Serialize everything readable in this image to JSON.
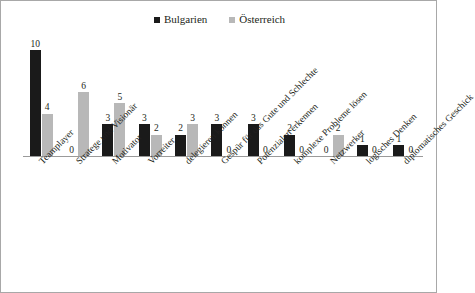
{
  "legend": {
    "entries": [
      {
        "label": "Bulgarien",
        "color": "#1a1a1a",
        "icon": "legend-square-icon"
      },
      {
        "label": "Österreich",
        "color": "#b8b8b8",
        "icon": "legend-square-icon"
      }
    ]
  },
  "chart_data": {
    "type": "bar",
    "title": "",
    "subtitle": "",
    "xlabel": "",
    "ylabel": "",
    "ylim": [
      0,
      10
    ],
    "grid": false,
    "legend_position": "top-center",
    "data_labels": true,
    "categories": [
      "Teamplayer",
      "Stratege und Visionär",
      "Motivator",
      "Vorreiter",
      "delegieren können",
      "Gespür für das Gute und Schlechte",
      "Potenzialen erkennen",
      "komplexe Probleme lösen",
      "Netzwerker",
      "logisches Denken",
      "diplomatisches Geschick"
    ],
    "series": [
      {
        "name": "Bulgarien",
        "color": "#1a1a1a",
        "values": [
          10,
          0,
          3,
          3,
          2,
          3,
          3,
          2,
          0,
          1,
          1
        ]
      },
      {
        "name": "Österreich",
        "color": "#b8b8b8",
        "values": [
          4,
          6,
          5,
          2,
          3,
          0,
          0,
          0,
          2,
          0,
          0
        ]
      }
    ]
  }
}
